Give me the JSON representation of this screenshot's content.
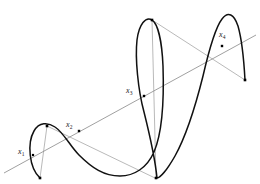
{
  "figure": {
    "background_color": "#ffffff",
    "curve_color": "#111111",
    "secant_color": "#777777",
    "chord_color": "#8a8a8a",
    "marker_color": "#000000",
    "label_color": "#1a1a1a",
    "width": 260,
    "height": 184
  },
  "labels": [
    {
      "id": "x1",
      "base": "x",
      "sub": "1",
      "x": 18,
      "y": 148,
      "anchor_point": [
        33,
        155
      ]
    },
    {
      "id": "x2",
      "base": "x",
      "sub": "2",
      "x": 66,
      "y": 121,
      "anchor_point": [
        79,
        131
      ]
    },
    {
      "id": "x3",
      "base": "x",
      "sub": "3",
      "x": 126,
      "y": 87,
      "anchor_point": [
        144,
        96
      ]
    },
    {
      "id": "x4",
      "base": "x",
      "sub": "4",
      "x": 219,
      "y": 31,
      "anchor_point": [
        222,
        46
      ]
    }
  ],
  "secant_line": {
    "name": "secant-line",
    "from": [
      4,
      173
    ],
    "to": [
      256,
      35
    ],
    "stroke_width": 0.7
  },
  "curve": {
    "name": "wave-curve",
    "stroke_width": 1.5,
    "path": "M 40 178 C 29 168 27 143 34 131 C 39 122 48 122 55 127 C 64 133 70 146 79 155 C 92 168 104 176 120 176 C 134 176 147 168 154 152 C 163 131 164 96 163 66 C 162 42 158 24 152 20 C 146 16 139 24 137 40 C 135 58 138 90 144 112 C 149 132 155 158 157 178 C 160 178 167 170 175 156 C 185 138 195 108 203 76 C 209 50 215 28 222 19 C 228 11 234 14 238 26 C 242 40 244 62 245 80"
  },
  "chords": [
    {
      "name": "chord-left-lobe",
      "from": [
        47,
        126
      ],
      "to": [
        40,
        178
      ],
      "stroke_width": 0.6
    },
    {
      "name": "chord-left-to-trough",
      "from": [
        47,
        126
      ],
      "to": [
        155,
        178
      ],
      "stroke_width": 0.6
    },
    {
      "name": "chord-peak-to-right-end",
      "from": [
        152,
        20
      ],
      "to": [
        245,
        80
      ],
      "stroke_width": 0.6
    },
    {
      "name": "vertical-peak-to-trough",
      "from": [
        152,
        20
      ],
      "to": [
        156,
        178
      ],
      "stroke_width": 0.6
    }
  ],
  "markers": [
    {
      "name": "vertex-left-lobe-bottom",
      "x": 40,
      "y": 178,
      "size": 2.6
    },
    {
      "name": "vertex-left-lobe-top",
      "x": 47,
      "y": 126,
      "size": 2.6
    },
    {
      "name": "root-point-x1",
      "x": 33,
      "y": 155,
      "size": 2.2
    },
    {
      "name": "root-point-x2",
      "x": 79,
      "y": 131,
      "size": 2.4
    },
    {
      "name": "root-point-x3",
      "x": 144,
      "y": 96,
      "size": 2.4
    },
    {
      "name": "vertex-curve-trough",
      "x": 156,
      "y": 178,
      "size": 2.6
    },
    {
      "name": "vertex-curve-peak",
      "x": 152,
      "y": 20,
      "size": 2.6
    },
    {
      "name": "root-point-x4",
      "x": 222,
      "y": 46,
      "size": 2.4
    },
    {
      "name": "vertex-right-end",
      "x": 245,
      "y": 80,
      "size": 2.6
    }
  ]
}
